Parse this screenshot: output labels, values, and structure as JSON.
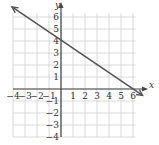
{
  "chart_data": {
    "type": "line",
    "title": "",
    "xlabel": "x",
    "ylabel": "y",
    "xlim": [
      -4,
      6
    ],
    "ylim": [
      -4,
      6
    ],
    "grid": true,
    "x_ticks": [
      "-4",
      "-3",
      "-2",
      "-1",
      "1",
      "2",
      "3",
      "4",
      "5",
      "6"
    ],
    "x_tick_values": [
      -4,
      -3,
      -2,
      -1,
      1,
      2,
      3,
      4,
      5,
      6
    ],
    "y_ticks": [
      "6",
      "5",
      "4",
      "3",
      "2",
      "1",
      "-1",
      "-2",
      "-3",
      "-4"
    ],
    "y_tick_values": [
      6,
      5,
      4,
      3,
      2,
      1,
      -1,
      -2,
      -3,
      -4
    ],
    "series": [
      {
        "name": "line",
        "equation": "y = -2/3 x + 4",
        "points": [
          [
            -4,
            6.67
          ],
          [
            0,
            4
          ],
          [
            6,
            0
          ],
          [
            6.8,
            -0.53
          ]
        ],
        "color": "#555555",
        "arrows": "both"
      }
    ]
  }
}
